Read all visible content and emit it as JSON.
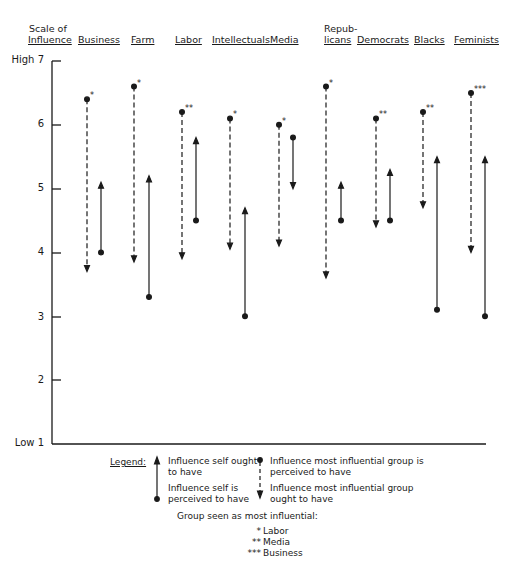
{
  "chart_data": {
    "type": "range-arrow",
    "title": "",
    "ylabel": "Scale of Influence",
    "ylim": [
      1,
      7
    ],
    "yticks": [
      {
        "value": 7,
        "label": "High 7"
      },
      {
        "value": 6,
        "label": "6"
      },
      {
        "value": 5,
        "label": "5"
      },
      {
        "value": 4,
        "label": "4"
      },
      {
        "value": 3,
        "label": "3"
      },
      {
        "value": 2,
        "label": "2"
      },
      {
        "value": 1,
        "label": "Low 1"
      }
    ],
    "categories": [
      "Business",
      "Farm",
      "Labor",
      "Intellectuals",
      "Media",
      "Republicans",
      "Democrats",
      "Blacks",
      "Feminists"
    ],
    "category_labels": [
      {
        "line1": "",
        "line2": "Business"
      },
      {
        "line1": "",
        "line2": "Farm"
      },
      {
        "line1": "",
        "line2": "Labor"
      },
      {
        "line1": "",
        "line2": "Intellectuals"
      },
      {
        "line1": "",
        "line2": "Media"
      },
      {
        "line1": "Repub-",
        "line2": "licans"
      },
      {
        "line1": "",
        "line2": "Democrats"
      },
      {
        "line1": "",
        "line2": "Blacks"
      },
      {
        "line1": "",
        "line2": "Feminists"
      }
    ],
    "series": [
      {
        "name": "Influence self is perceived to have",
        "values": [
          4.0,
          3.3,
          4.5,
          3.0,
          5.8,
          4.5,
          4.5,
          3.1,
          3.0
        ]
      },
      {
        "name": "Influence self ought to have",
        "values": [
          5.1,
          5.2,
          5.8,
          4.7,
          5.0,
          5.1,
          5.3,
          5.5,
          5.5
        ]
      },
      {
        "name": "Influence most influential group is perceived to have",
        "values": [
          6.4,
          6.6,
          6.2,
          6.1,
          6.0,
          6.6,
          6.1,
          6.2,
          6.5
        ]
      },
      {
        "name": "Influence most influential group ought to have",
        "values": [
          3.7,
          3.85,
          3.9,
          4.05,
          4.1,
          3.6,
          4.4,
          4.7,
          4.0
        ]
      }
    ],
    "most_influential_marker": [
      "*",
      "*",
      "**",
      "*",
      "*",
      "*",
      "**",
      "**",
      "***"
    ],
    "grid": false,
    "legend_position": "bottom"
  },
  "header": {
    "scale_line1": "Scale of",
    "scale_line2": "Influence"
  },
  "legend": {
    "title": "Legend:",
    "solid_ought": "Influence self ought",
    "solid_ought2": "to have",
    "solid_perceived": "Influence self is",
    "solid_perceived2": "perceived to have",
    "dashed_perceived": "Influence most influential group is",
    "dashed_perceived2": "perceived to have",
    "dashed_ought": "Influence most influential group",
    "dashed_ought2": "ought to have",
    "group_title": "Group seen as most influential:",
    "keys": [
      {
        "mark": "*",
        "label": "Labor"
      },
      {
        "mark": "**",
        "label": "Media"
      },
      {
        "mark": "***",
        "label": "Business"
      }
    ]
  }
}
